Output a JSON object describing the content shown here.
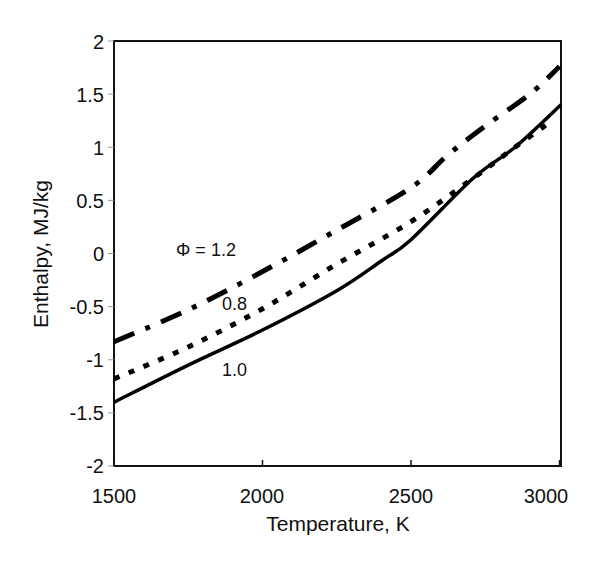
{
  "chart_data": {
    "type": "line",
    "title": "",
    "xlabel": "Temperature, K",
    "ylabel": "Enthalpy, MJ/kg",
    "xlim": [
      1500,
      3005
    ],
    "ylim": [
      -2,
      2
    ],
    "xticks": [
      1500,
      2000,
      2500,
      3000
    ],
    "xtick_labels": [
      "1500",
      "2000",
      "2500",
      "3000"
    ],
    "yticks": [
      2,
      1.5,
      1,
      0.5,
      0,
      -0.5,
      -1,
      -1.5,
      -2
    ],
    "ytick_labels": [
      "2",
      "1.5",
      "1",
      "0.5",
      "0",
      "-0.5",
      "-1",
      "-1.5",
      "-2"
    ],
    "grid": false,
    "legend": "none (inline annotations)",
    "series": [
      {
        "name": "Φ = 1.2",
        "style": "dash-dot",
        "x": [
          1500,
          1750,
          2000,
          2250,
          2500,
          2625,
          2750,
          2900,
          3000
        ],
        "values": [
          -0.83,
          -0.53,
          -0.17,
          0.22,
          0.62,
          0.93,
          1.2,
          1.5,
          1.76
        ]
      },
      {
        "name": "Φ = 0.8",
        "style": "dotted",
        "x": [
          1500,
          1750,
          2000,
          2250,
          2500,
          2710,
          2850,
          2970
        ],
        "values": [
          -1.18,
          -0.88,
          -0.52,
          -0.1,
          0.3,
          0.71,
          1.0,
          1.24
        ]
      },
      {
        "name": "Φ = 1.0",
        "style": "solid",
        "x": [
          1500,
          1750,
          2000,
          2250,
          2400,
          2500,
          2710,
          2850,
          3005
        ],
        "values": [
          -1.4,
          -1.05,
          -0.72,
          -0.35,
          -0.07,
          0.13,
          0.71,
          1.0,
          1.4
        ]
      }
    ],
    "annotations": [
      {
        "text": "Φ = 1.2",
        "x": 1720,
        "y": 0.05
      },
      {
        "text": "0.8",
        "x": 1870,
        "y": -0.6
      },
      {
        "text": "1.0",
        "x": 1870,
        "y": -1.2
      }
    ]
  },
  "labels": {
    "xlabel": "Temperature, K",
    "ylabel": "Enthalpy, MJ/kg",
    "annot_phi12": "Φ = 1.2",
    "annot_08": "0.8",
    "annot_10": "1.0",
    "xt0": "1500",
    "xt1": "2000",
    "xt2": "2500",
    "xt3": "3000",
    "yt0": "2",
    "yt1": "1.5",
    "yt2": "1",
    "yt3": "0.5",
    "yt4": "0",
    "yt5": "-0.5",
    "yt6": "-1",
    "yt7": "-1.5",
    "yt8": "-2"
  }
}
